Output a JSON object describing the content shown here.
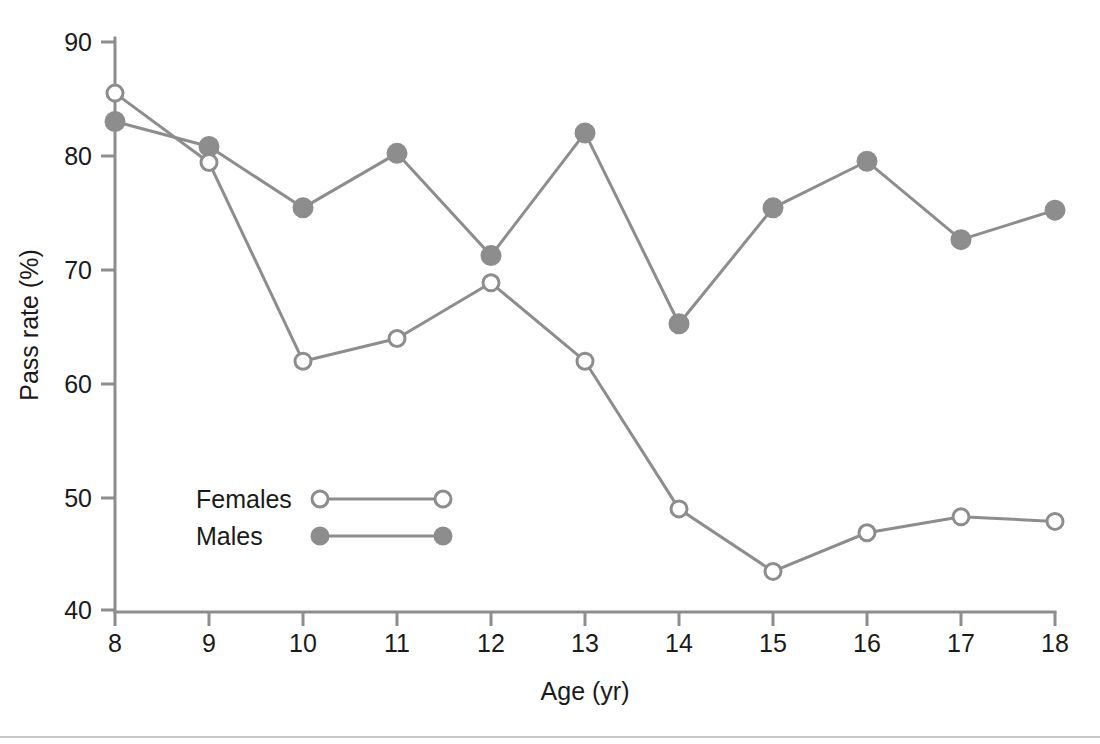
{
  "chart_data": {
    "type": "line",
    "title": "",
    "xlabel": "Age (yr)",
    "ylabel": "Pass rate (%)",
    "x": [
      8,
      9,
      10,
      11,
      12,
      13,
      14,
      15,
      16,
      17,
      18
    ],
    "xticklabels": [
      "8",
      "9",
      "10",
      "11",
      "12",
      "13",
      "14",
      "15",
      "16",
      "17",
      "18"
    ],
    "yticks": [
      40,
      50,
      60,
      70,
      80,
      90
    ],
    "yticklabels": [
      "40",
      "50",
      "60",
      "70",
      "80",
      "90"
    ],
    "xlim": [
      8,
      18
    ],
    "ylim": [
      40,
      90
    ],
    "grid": false,
    "legend_position": "inside-lower-left",
    "series": [
      {
        "name": "Females",
        "marker": "open-circle",
        "color": "#8d8d8d",
        "values": [
          85.5,
          79.4,
          61.9,
          63.9,
          68.8,
          61.9,
          48.9,
          43.4,
          46.8,
          48.2,
          47.8
        ]
      },
      {
        "name": "Males",
        "marker": "filled-circle",
        "color": "#8d8d8d",
        "values": [
          83.0,
          80.8,
          75.4,
          80.2,
          71.2,
          82.0,
          65.2,
          75.4,
          79.5,
          72.6,
          75.2
        ]
      }
    ]
  },
  "axes": {
    "x_title": "Age (yr)",
    "y_title": "Pass rate (%)"
  },
  "legend": {
    "entries": [
      {
        "label": "Females"
      },
      {
        "label": "Males"
      }
    ]
  },
  "ticks": {
    "y": [
      "90",
      "80",
      "70",
      "60",
      "50",
      "40"
    ],
    "x": [
      "8",
      "9",
      "10",
      "11",
      "12",
      "13",
      "14",
      "15",
      "16",
      "17",
      "18"
    ]
  }
}
